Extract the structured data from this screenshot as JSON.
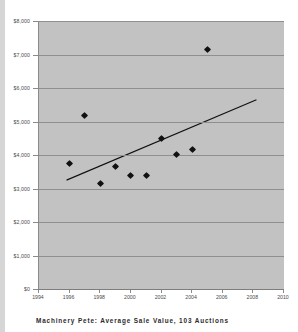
{
  "caption": "Machinery Pete:  Average  Sale  Value,  103  Auctions",
  "colors": {
    "plot_background": "#c2c2c2",
    "gridline": "#8f8f8f",
    "marker": "#111111",
    "trendline": "#111111",
    "page_background": "#ffffff",
    "edge_strip": "#d6d6d6",
    "axis_text": "#4a4a4a"
  },
  "chart_data": {
    "type": "scatter",
    "title": "Machinery Pete:  Average  Sale  Value,  103  Auctions",
    "xlabel": "",
    "ylabel": "",
    "xlim": [
      1994,
      2010
    ],
    "ylim": [
      0,
      8000
    ],
    "grid": true,
    "legend": "none",
    "x_tick_labels": [
      "1994",
      "1996",
      "1998",
      "2000",
      "2002",
      "2004",
      "2006",
      "2008",
      "2010"
    ],
    "x_ticks": [
      1994,
      1996,
      1998,
      2000,
      2002,
      2004,
      2006,
      2008,
      2010
    ],
    "y_tick_labels": [
      "$0",
      "$1,000",
      "$2,000",
      "$3,000",
      "$4,000",
      "$5,000",
      "$6,000",
      "$7,000",
      "$8,000"
    ],
    "y_ticks": [
      0,
      1000,
      2000,
      3000,
      4000,
      5000,
      6000,
      7000,
      8000
    ],
    "points": [
      {
        "x": 1996.0,
        "y": 3750
      },
      {
        "x": 1997.0,
        "y": 5180
      },
      {
        "x": 1998.0,
        "y": 3150
      },
      {
        "x": 1999.0,
        "y": 3650
      },
      {
        "x": 2000.0,
        "y": 3400
      },
      {
        "x": 2001.0,
        "y": 3400
      },
      {
        "x": 2002.0,
        "y": 4480
      },
      {
        "x": 2003.0,
        "y": 4020
      },
      {
        "x": 2004.0,
        "y": 4170
      },
      {
        "x": 2005.0,
        "y": 7150
      }
    ],
    "trendline": {
      "type": "linear",
      "x_start": 1995.8,
      "y_start": 3250,
      "x_end": 2008.2,
      "y_end": 5650
    }
  }
}
